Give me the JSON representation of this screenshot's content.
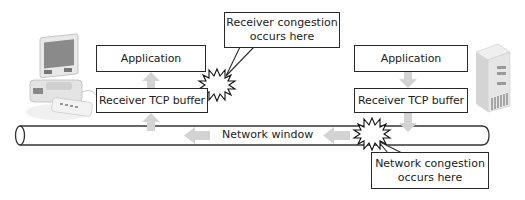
{
  "diagram": {
    "left_host": {
      "device": "desktop-computer",
      "application_label": "Application",
      "buffer_label": "Receiver TCP buffer",
      "flow_direction": "up"
    },
    "right_host": {
      "device": "server-tower",
      "application_label": "Application",
      "buffer_label": "Receiver TCP buffer",
      "flow_direction": "down"
    },
    "network": {
      "label": "Network window",
      "flow_direction": "left"
    },
    "callouts": {
      "receiver": {
        "line1": "Receiver congestion",
        "line2": "occurs here"
      },
      "network": {
        "line1": "Network congestion",
        "line2": "occurs here"
      }
    },
    "colors": {
      "outline": "#2a2a2a",
      "arrow_fill": "#d3d3d3",
      "background": "#ffffff"
    }
  }
}
